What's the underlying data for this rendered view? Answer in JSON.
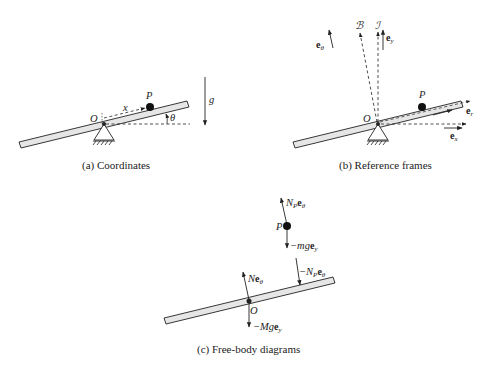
{
  "panels": [
    {
      "id": "a",
      "caption": "(a) Coordinates",
      "labels": {
        "origin": "O",
        "point": "P",
        "coordinate": "x",
        "angle": "θ",
        "gravity": "g"
      }
    },
    {
      "id": "b",
      "caption": "(b) Reference frames",
      "labels": {
        "origin": "O",
        "point": "P",
        "body_frame": "ℬ",
        "inertial_frame": "ℐ",
        "e_theta": "e",
        "e_theta_sub": "θ",
        "e_y": "e",
        "e_y_sub": "y",
        "e_r": "e",
        "e_r_sub": "r",
        "e_x": "e",
        "e_x_sub": "x"
      }
    },
    {
      "id": "c",
      "caption": "(c) Free-body diagrams",
      "labels": {
        "origin": "O",
        "point": "P",
        "normal_on_P_pre": "N",
        "normal_on_P_pre_sub": "P",
        "normal_on_P_vec": "e",
        "normal_on_P_vec_sub": "θ",
        "weight_P_pre": "−mg",
        "weight_P_vec": "e",
        "weight_P_vec_sub": "y",
        "reaction_on_bar_pre": "−N",
        "reaction_on_bar_pre_sub": "P",
        "reaction_on_bar_vec": "e",
        "reaction_on_bar_vec_sub": "θ",
        "pivot_normal_pre": "N",
        "pivot_normal_vec": "e",
        "pivot_normal_vec_sub": "θ",
        "weight_bar_pre": "−Mg",
        "weight_bar_vec": "e",
        "weight_bar_vec_sub": "y"
      }
    }
  ],
  "colors": {
    "stroke": "#222222",
    "bar_fill": "#e6e6e6",
    "background": "#ffffff"
  }
}
